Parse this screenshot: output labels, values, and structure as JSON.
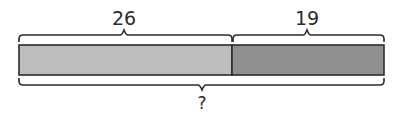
{
  "diagram": {
    "type": "tape-diagram",
    "segments": [
      {
        "label": "26",
        "value": 26,
        "color": "#bdbdbd"
      },
      {
        "label": "19",
        "value": 19,
        "color": "#8f8f8f"
      }
    ],
    "total_label": "?",
    "stroke_color": "#2b2b2b"
  }
}
